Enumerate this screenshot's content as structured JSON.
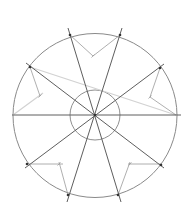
{
  "diagram": {
    "title": "Construction of an eight-part radial division in a circle",
    "colors": {
      "background": "#ffffff",
      "outer_circle": "#8a8a8a",
      "inner_circle": "#8f8f8f",
      "radial_line": "#5e5e5e",
      "construction_line": "#9a9a9a",
      "faint_line": "#d2d2d2",
      "point": "#333333"
    },
    "center": {
      "x": 95,
      "y": 115
    },
    "outer_circle": {
      "cx": 95,
      "cy": 115.5,
      "r": 82
    },
    "inner_circle": {
      "cx": 95,
      "cy": 115,
      "r": 25
    },
    "radial_lines": [
      {
        "x1": 12,
        "y1": 115,
        "x2": 181,
        "y2": 115
      },
      {
        "x1": 68,
        "y1": 28,
        "x2": 121,
        "y2": 202
      },
      {
        "x1": 122,
        "y1": 28,
        "x2": 67,
        "y2": 202
      },
      {
        "x1": 26,
        "y1": 63,
        "x2": 164,
        "y2": 168
      },
      {
        "x1": 164,
        "y1": 64,
        "x2": 25,
        "y2": 168
      }
    ],
    "points": [
      {
        "x": 70,
        "y": 35
      },
      {
        "x": 120,
        "y": 35
      },
      {
        "x": 30,
        "y": 67
      },
      {
        "x": 160,
        "y": 68
      },
      {
        "x": 27,
        "y": 164
      },
      {
        "x": 161,
        "y": 165
      },
      {
        "x": 68,
        "y": 195
      },
      {
        "x": 118,
        "y": 195
      },
      {
        "x": 95,
        "y": 115
      }
    ],
    "construction_lines": [
      {
        "x1": 70,
        "y1": 35,
        "x2": 93,
        "y2": 56
      },
      {
        "x1": 93,
        "y1": 56,
        "x2": 120,
        "y2": 35
      },
      {
        "x1": 30,
        "y1": 67,
        "x2": 40,
        "y2": 96
      },
      {
        "x1": 160,
        "y1": 68,
        "x2": 150,
        "y2": 97
      },
      {
        "x1": 150,
        "y1": 97,
        "x2": 176,
        "y2": 115
      },
      {
        "x1": 27,
        "y1": 164,
        "x2": 63,
        "y2": 164
      },
      {
        "x1": 59,
        "y1": 162,
        "x2": 68,
        "y2": 195
      },
      {
        "x1": 128,
        "y1": 164,
        "x2": 161,
        "y2": 164
      },
      {
        "x1": 130,
        "y1": 162,
        "x2": 118,
        "y2": 195
      }
    ],
    "faint_lines": [
      {
        "x1": 30,
        "y1": 67,
        "x2": 176,
        "y2": 115
      },
      {
        "x1": 13,
        "y1": 115,
        "x2": 43,
        "y2": 93
      }
    ],
    "ticks": [
      {
        "x": 93,
        "y": 56
      },
      {
        "x": 40,
        "y": 96
      },
      {
        "x": 150,
        "y": 97
      },
      {
        "x": 59,
        "y": 164
      },
      {
        "x": 130,
        "y": 164
      }
    ]
  }
}
